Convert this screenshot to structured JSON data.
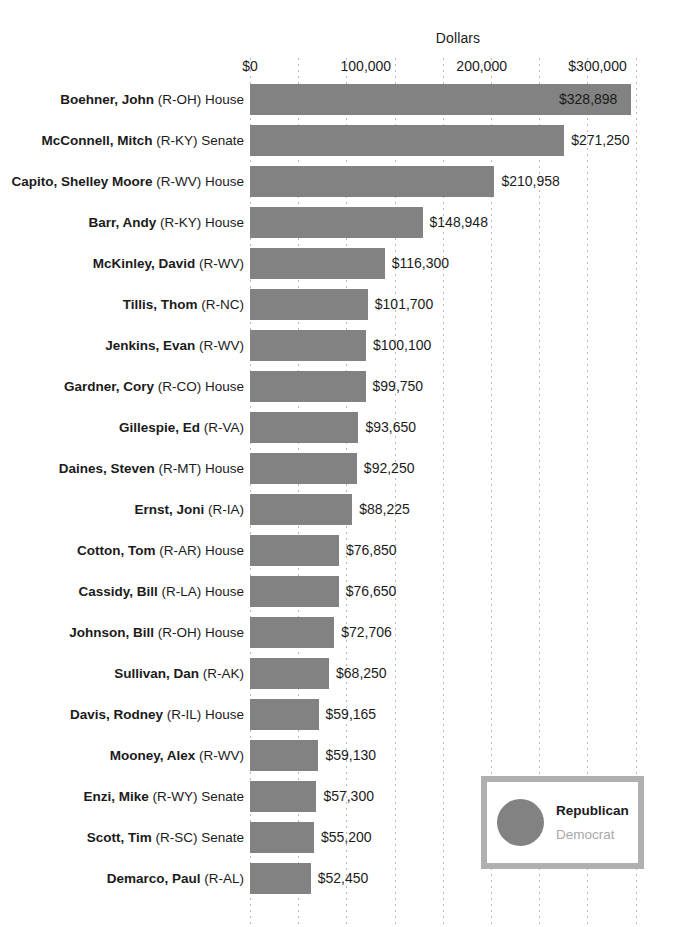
{
  "chart_data": {
    "type": "bar",
    "orientation": "horizontal",
    "title": "Dollars",
    "xlabel": "Dollars",
    "ylabel": "",
    "xlim": [
      0,
      300000
    ],
    "x_ticks": [
      {
        "value": 0,
        "label": "$0"
      },
      {
        "value": 100000,
        "label": "100,000"
      },
      {
        "value": 200000,
        "label": "200,000"
      },
      {
        "value": 300000,
        "label": "$300,000"
      }
    ],
    "grid": "vertical dotted",
    "legend_position": "bottom-right",
    "bar_color": "#828282",
    "categories": [
      "Boehner, John (R-OH) House",
      "McConnell, Mitch (R-KY) Senate",
      "Capito, Shelley Moore (R-WV) House",
      "Barr, Andy (R-KY) House",
      "McKinley, David (R-WV)",
      "Tillis, Thom (R-NC)",
      "Jenkins, Evan (R-WV)",
      "Gardner, Cory (R-CO) House",
      "Gillespie, Ed (R-VA)",
      "Daines, Steven (R-MT) House",
      "Ernst, Joni (R-IA)",
      "Cotton, Tom (R-AR) House",
      "Cassidy, Bill (R-LA) House",
      "Johnson, Bill (R-OH) House",
      "Sullivan, Dan (R-AK)",
      "Davis, Rodney (R-IL) House",
      "Mooney, Alex (R-WV)",
      "Enzi, Mike (R-WY) Senate",
      "Scott, Tim (R-SC) Senate",
      "Demarco, Paul (R-AL)"
    ],
    "values": [
      328898,
      271250,
      210958,
      148948,
      116300,
      101700,
      100100,
      99750,
      93650,
      92250,
      88225,
      76850,
      76650,
      72706,
      68250,
      59165,
      59130,
      57300,
      55200,
      52450
    ],
    "value_labels": [
      "$328,898",
      "$271,250",
      "$210,958",
      "$148,948",
      "$116,300",
      "$101,700",
      "$100,100",
      "$99,750",
      "$93,650",
      "$92,250",
      "$88,225",
      "$76,850",
      "$76,650",
      "$72,706",
      "$68,250",
      "$59,165",
      "$59,130",
      "$57,300",
      "$55,200",
      "$52,450"
    ]
  },
  "rows": [
    {
      "name": "Boehner, John",
      "meta": "(R-OH) House",
      "value": 328898,
      "value_label": "$328,898",
      "party": "Republican"
    },
    {
      "name": "McConnell, Mitch",
      "meta": "(R-KY) Senate",
      "value": 271250,
      "value_label": "$271,250",
      "party": "Republican"
    },
    {
      "name": "Capito, Shelley Moore",
      "meta": "(R-WV) House",
      "value": 210958,
      "value_label": "$210,958",
      "party": "Republican"
    },
    {
      "name": "Barr, Andy",
      "meta": "(R-KY) House",
      "value": 148948,
      "value_label": "$148,948",
      "party": "Republican"
    },
    {
      "name": "McKinley, David",
      "meta": "(R-WV)",
      "value": 116300,
      "value_label": "$116,300",
      "party": "Republican"
    },
    {
      "name": "Tillis, Thom",
      "meta": "(R-NC)",
      "value": 101700,
      "value_label": "$101,700",
      "party": "Republican"
    },
    {
      "name": "Jenkins, Evan",
      "meta": "(R-WV)",
      "value": 100100,
      "value_label": "$100,100",
      "party": "Republican"
    },
    {
      "name": "Gardner, Cory",
      "meta": "(R-CO) House",
      "value": 99750,
      "value_label": "$99,750",
      "party": "Republican"
    },
    {
      "name": "Gillespie, Ed",
      "meta": "(R-VA)",
      "value": 93650,
      "value_label": "$93,650",
      "party": "Republican"
    },
    {
      "name": "Daines, Steven",
      "meta": "(R-MT) House",
      "value": 92250,
      "value_label": "$92,250",
      "party": "Republican"
    },
    {
      "name": "Ernst, Joni",
      "meta": "(R-IA)",
      "value": 88225,
      "value_label": "$88,225",
      "party": "Republican"
    },
    {
      "name": "Cotton, Tom",
      "meta": "(R-AR) House",
      "value": 76850,
      "value_label": "$76,850",
      "party": "Republican"
    },
    {
      "name": "Cassidy, Bill",
      "meta": "(R-LA) House",
      "value": 76650,
      "value_label": "$76,650",
      "party": "Republican"
    },
    {
      "name": "Johnson, Bill",
      "meta": "(R-OH) House",
      "value": 72706,
      "value_label": "$72,706",
      "party": "Republican"
    },
    {
      "name": "Sullivan, Dan",
      "meta": "(R-AK)",
      "value": 68250,
      "value_label": "$68,250",
      "party": "Republican"
    },
    {
      "name": "Davis, Rodney",
      "meta": "(R-IL) House",
      "value": 59165,
      "value_label": "$59,165",
      "party": "Republican"
    },
    {
      "name": "Mooney, Alex",
      "meta": "(R-WV)",
      "value": 59130,
      "value_label": "$59,130",
      "party": "Republican"
    },
    {
      "name": "Enzi, Mike",
      "meta": "(R-WY) Senate",
      "value": 57300,
      "value_label": "$57,300",
      "party": "Republican"
    },
    {
      "name": "Scott, Tim",
      "meta": "(R-SC) Senate",
      "value": 55200,
      "value_label": "$55,200",
      "party": "Republican"
    },
    {
      "name": "Demarco, Paul",
      "meta": "(R-AL)",
      "value": 52450,
      "value_label": "$52,450",
      "party": "Republican"
    }
  ],
  "legend": {
    "republican_label": "Republican",
    "democrat_label": "Democrat",
    "republican_color": "#828282",
    "democrat_color": "#a9a9a9"
  }
}
